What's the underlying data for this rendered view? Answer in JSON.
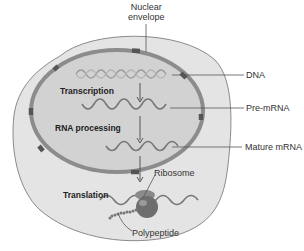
{
  "diagram": {
    "labels": {
      "nuclear_envelope_line1": "Nuclear",
      "nuclear_envelope_line2": "envelope",
      "dna": "DNA",
      "pre_mrna": "Pre-mRNA",
      "mature_mrna": "Mature mRNA",
      "ribosome": "Ribosome",
      "polypeptide": "Polypeptide"
    },
    "steps": {
      "transcription": "Transcription",
      "rna_processing": "RNA processing",
      "translation": "Translation"
    },
    "colors": {
      "cytoplasm": "#e2e2e2",
      "cell_outline": "#8a8a8a",
      "nucleus": "#d0d0d0",
      "nuclear_envelope": "#8c8c8c",
      "nuclear_pore": "#555555",
      "ribosome": "#6e6e6e"
    }
  }
}
